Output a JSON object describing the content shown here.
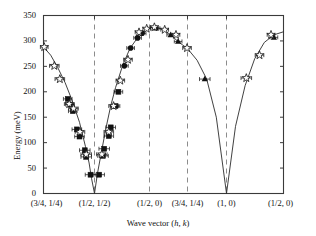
{
  "chart_data": {
    "type": "line",
    "title": "",
    "xlabel": "Wave vector (h, k)",
    "ylabel": "Energy (meV)",
    "ylim": [
      0,
      350
    ],
    "yticks": [
      0,
      50,
      100,
      150,
      200,
      250,
      300,
      350
    ],
    "ytick_labels": [
      "0",
      "50",
      "100",
      "150",
      "200",
      "250",
      "300",
      "350"
    ],
    "xtick_labels": [
      "(3/4, 1/4)",
      "(1/2, 1/2)",
      "(1/2, 0)",
      "(3/4, 1/4)",
      "(1, 0)",
      "(1/2, 0)"
    ],
    "xtick_positions": [
      0.0,
      0.2125,
      0.4417,
      0.6,
      0.7625,
      1.0
    ],
    "grid": "vertical dashed lines at (1/2,1/2), (1/2,0), (3/4,1/4), (1,0)",
    "gridline_positions": [
      0.2125,
      0.4417,
      0.6,
      0.7625
    ],
    "legend": [],
    "legend_position": "none",
    "series": [
      {
        "name": "dispersion-curve",
        "marker": "none",
        "style": "solid-line",
        "x": [
          0.0,
          0.03,
          0.06,
          0.09,
          0.12,
          0.15,
          0.175,
          0.19,
          0.2,
          0.2125,
          0.225,
          0.24,
          0.26,
          0.28,
          0.3,
          0.33,
          0.36,
          0.39,
          0.42,
          0.4417,
          0.47,
          0.5,
          0.53,
          0.56,
          0.58,
          0.6,
          0.64,
          0.68,
          0.72,
          0.7625,
          0.8,
          0.84,
          0.88,
          0.92,
          0.96,
          1.0
        ],
        "y": [
          288,
          272,
          247,
          218,
          182,
          140,
          92,
          60,
          30,
          0,
          40,
          78,
          128,
          172,
          208,
          252,
          285,
          305,
          318,
          326,
          327,
          322,
          312,
          299,
          292,
          285,
          262,
          225,
          150,
          0,
          132,
          212,
          265,
          297,
          312,
          318
        ]
      },
      {
        "name": "filled-squares",
        "marker": "filled-square",
        "points": [
          {
            "x": 0.101,
            "y": 186,
            "xerr": 0.018
          },
          {
            "x": 0.11,
            "y": 175,
            "xerr": 0.018
          },
          {
            "x": 0.122,
            "y": 162,
            "xerr": 0.018
          },
          {
            "x": 0.139,
            "y": 126,
            "xerr": 0.02
          },
          {
            "x": 0.15,
            "y": 112,
            "xerr": 0.02
          },
          {
            "x": 0.172,
            "y": 85,
            "xerr": 0.022
          },
          {
            "x": 0.178,
            "y": 72,
            "xerr": 0.022
          },
          {
            "x": 0.196,
            "y": 37,
            "xerr": 0.022
          },
          {
            "x": 0.232,
            "y": 37,
            "xerr": 0.022
          },
          {
            "x": 0.248,
            "y": 74,
            "xerr": 0.022
          },
          {
            "x": 0.253,
            "y": 88,
            "xerr": 0.022
          },
          {
            "x": 0.272,
            "y": 113,
            "xerr": 0.02
          },
          {
            "x": 0.28,
            "y": 130,
            "xerr": 0.02
          },
          {
            "x": 0.3,
            "y": 172,
            "xerr": 0.018
          },
          {
            "x": 0.312,
            "y": 200,
            "xerr": 0.018
          }
        ]
      },
      {
        "name": "filled-circles",
        "marker": "filled-circle",
        "points": [
          {
            "x": 0.337,
            "y": 251,
            "xerr": 0.016
          },
          {
            "x": 0.363,
            "y": 286,
            "xerr": 0.016
          },
          {
            "x": 0.392,
            "y": 306,
            "xerr": 0.016
          },
          {
            "x": 0.411,
            "y": 315,
            "xerr": 0.016
          }
        ]
      },
      {
        "name": "filled-triangles",
        "marker": "filled-triangle",
        "points": [
          {
            "x": 0.469,
            "y": 325,
            "xerr": 0.016
          },
          {
            "x": 0.53,
            "y": 312,
            "xerr": 0.016
          },
          {
            "x": 0.561,
            "y": 299,
            "xerr": 0.016
          },
          {
            "x": 0.672,
            "y": 225,
            "xerr": 0.022
          },
          {
            "x": 0.96,
            "y": 307,
            "xerr": 0.016
          }
        ]
      },
      {
        "name": "open-stars",
        "marker": "open-star",
        "points": [
          {
            "x": 0.003,
            "y": 288,
            "xerr": 0.016
          },
          {
            "x": 0.045,
            "y": 251,
            "xerr": 0.02
          },
          {
            "x": 0.068,
            "y": 225,
            "xerr": 0.02
          },
          {
            "x": 0.107,
            "y": 176,
            "xerr": 0.02
          },
          {
            "x": 0.125,
            "y": 167,
            "xerr": 0.02
          },
          {
            "x": 0.152,
            "y": 121,
            "xerr": 0.02
          },
          {
            "x": 0.178,
            "y": 77,
            "xerr": 0.022
          },
          {
            "x": 0.243,
            "y": 77,
            "xerr": 0.022
          },
          {
            "x": 0.272,
            "y": 121,
            "xerr": 0.02
          },
          {
            "x": 0.292,
            "y": 172,
            "xerr": 0.02
          },
          {
            "x": 0.32,
            "y": 222,
            "xerr": 0.018
          },
          {
            "x": 0.352,
            "y": 263,
            "xerr": 0.018
          },
          {
            "x": 0.398,
            "y": 317,
            "xerr": 0.016
          },
          {
            "x": 0.43,
            "y": 324,
            "xerr": 0.016
          },
          {
            "x": 0.462,
            "y": 327,
            "xerr": 0.016
          },
          {
            "x": 0.505,
            "y": 322,
            "xerr": 0.016
          },
          {
            "x": 0.552,
            "y": 312,
            "xerr": 0.016
          },
          {
            "x": 0.598,
            "y": 286,
            "xerr": 0.018
          },
          {
            "x": 0.845,
            "y": 227,
            "xerr": 0.022
          },
          {
            "x": 0.9,
            "y": 272,
            "xerr": 0.018
          },
          {
            "x": 0.948,
            "y": 312,
            "xerr": 0.016
          }
        ]
      }
    ]
  },
  "axes": {
    "y_title": "Energy (meV)",
    "x_title_prefix": "Wave vector (",
    "x_title_h": "h",
    "x_title_comma": ", ",
    "x_title_k": "k",
    "x_title_suffix": ")"
  },
  "colors": {
    "frame": "#3a3a3a",
    "curve": "#2b2b2b",
    "gridline": "#8c8c8c",
    "marker_fill": "#111111",
    "marker_open": "#ffffff",
    "text": "#111111",
    "background": "#ffffff"
  }
}
